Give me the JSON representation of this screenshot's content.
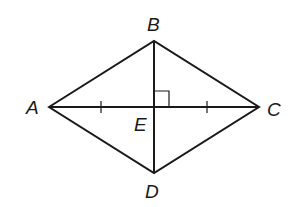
{
  "diagram": {
    "type": "rhombus",
    "vertices": {
      "A": {
        "label": "A",
        "x": 49,
        "y": 107
      },
      "B": {
        "label": "B",
        "x": 154,
        "y": 41
      },
      "C": {
        "label": "C",
        "x": 259,
        "y": 107
      },
      "D": {
        "label": "D",
        "x": 154,
        "y": 173
      },
      "E": {
        "label": "E",
        "x": 154,
        "y": 107
      }
    },
    "labels": {
      "A": "A",
      "B": "B",
      "C": "C",
      "D": "D",
      "E": "E"
    },
    "segments": [
      "AB",
      "BC",
      "CD",
      "DA",
      "AC",
      "BD"
    ],
    "marks": {
      "right_angle_at": "E",
      "congruent_ticks": [
        "AE",
        "EC"
      ]
    },
    "colors": {
      "stroke": "#1a1a1a",
      "background": "#ffffff"
    }
  }
}
